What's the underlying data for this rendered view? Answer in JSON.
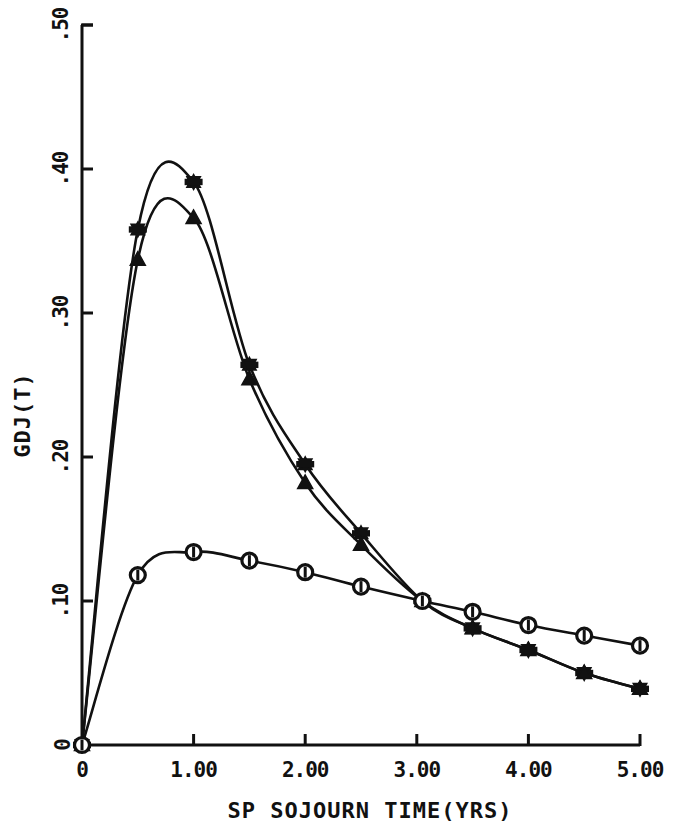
{
  "chart_data": {
    "type": "line",
    "title": "",
    "subtitle": "",
    "xlabel": "SP SOJOURN TIME(YRS)",
    "ylabel": "GDJ(T)",
    "xlim": [
      0,
      5
    ],
    "ylim": [
      0,
      0.5
    ],
    "grid": false,
    "legend": "none",
    "xticks": [
      0,
      1,
      2,
      3,
      4,
      5
    ],
    "xtick_labels": [
      "0",
      "1.00",
      "2.00",
      "3.00",
      "4.00",
      "5.00"
    ],
    "yticks": [
      0,
      0.1,
      0.2,
      0.3,
      0.4,
      0.5
    ],
    "ytick_labels": [
      "0",
      ".10",
      ".20",
      ".30",
      ".40",
      ".50"
    ],
    "series": [
      {
        "name": "series-star",
        "marker": "star",
        "x": [
          0.0,
          0.5,
          1.0,
          1.5,
          2.0,
          2.5,
          3.05,
          3.5,
          4.0,
          4.5,
          5.0
        ],
        "values": [
          0.0,
          0.358,
          0.391,
          0.264,
          0.195,
          0.147,
          0.1,
          0.081,
          0.066,
          0.05,
          0.039
        ]
      },
      {
        "name": "series-triangle",
        "marker": "triangle",
        "x": [
          0.0,
          0.5,
          1.0,
          1.5,
          2.0,
          2.5,
          3.05,
          3.5,
          4.0,
          4.5,
          5.0
        ],
        "values": [
          0.0,
          0.337,
          0.366,
          0.254,
          0.182,
          0.139,
          0.1,
          0.081,
          0.066,
          0.05,
          0.039
        ]
      },
      {
        "name": "series-circle",
        "marker": "circle-dot",
        "x": [
          0.0,
          0.5,
          1.0,
          1.5,
          2.0,
          2.5,
          3.05,
          3.5,
          4.0,
          4.5,
          5.0
        ],
        "values": [
          0.0,
          0.118,
          0.134,
          0.128,
          0.12,
          0.11,
          0.1,
          0.0925,
          0.0833,
          0.076,
          0.069
        ]
      }
    ]
  },
  "axes": {
    "y_title": "GDJ(T)",
    "x_title": "SP SOJOURN TIME(YRS)",
    "y_tick_labels": [
      "0",
      ".10",
      ".20",
      ".30",
      ".40",
      ".50"
    ],
    "x_tick_labels": [
      "0",
      "1.00",
      "2.00",
      "3.00",
      "4.00",
      "5.00"
    ]
  },
  "style": {
    "line_color": "#111111",
    "axis_color": "#111111",
    "background": "#ffffff"
  }
}
